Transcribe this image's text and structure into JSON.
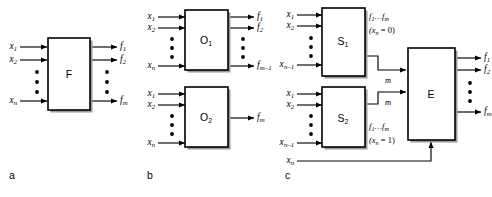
{
  "figure": {
    "panels": [
      {
        "id": "a",
        "letter": "a",
        "boxes": [
          {
            "name": "F",
            "label": "F",
            "inputs": [
              "x1",
              "x2",
              "vdots",
              "xn"
            ],
            "outputs": [
              "f1",
              "f2",
              "vdots",
              "fm"
            ]
          }
        ]
      },
      {
        "id": "b",
        "letter": "b",
        "boxes": [
          {
            "name": "O1",
            "label": "O",
            "sub": "1",
            "inputs": [
              "x1",
              "x2",
              "vdots",
              "xn"
            ],
            "outputs": [
              "f1",
              "f2",
              "vdots",
              "fm-1"
            ]
          },
          {
            "name": "O2",
            "label": "O",
            "sub": "2",
            "inputs": [
              "x1",
              "x2",
              "vdots",
              "xn"
            ],
            "outputs": [
              "fm"
            ]
          }
        ]
      },
      {
        "id": "c",
        "letter": "c",
        "boxes": [
          {
            "name": "S1",
            "label": "S",
            "sub": "1",
            "inputs": [
              "x1",
              "x2",
              "vdots",
              "xn-1"
            ]
          },
          {
            "name": "S2",
            "label": "S",
            "sub": "2",
            "inputs": [
              "x1",
              "x2",
              "vdots",
              "xn-1"
            ]
          },
          {
            "name": "E",
            "label": "E",
            "outputs": [
              "f1",
              "f2",
              "vdots",
              "fm"
            ]
          }
        ],
        "extra_input": "xn"
      }
    ]
  },
  "labels": {
    "x1": "x",
    "x1_sub": "1",
    "x2": "x",
    "x2_sub": "2",
    "xn": "x",
    "xn_sub": "n",
    "xn1": "x",
    "xn1_sub": "n–1",
    "f1": "f",
    "f1_sub": "1",
    "f2": "f",
    "f2_sub": "2",
    "fm": "f",
    "fm_sub": "m",
    "fm1": "f",
    "fm1_sub": "m–1",
    "m_bus": "m"
  },
  "box_labels": {
    "F": "F",
    "O": "O",
    "O1_sub": "1",
    "O2_sub": "2",
    "S": "S",
    "S1_sub": "1",
    "S2_sub": "2",
    "E": "E"
  },
  "notes": {
    "bus_top_main": "f",
    "bus_top_sub1": "1",
    "bus_top_mid": "…f",
    "bus_top_sub2": "m",
    "cond_zero": "(x",
    "cond_zero_sub": "n",
    "cond_zero_tail": " = 0)",
    "cond_one": "(x",
    "cond_one_sub": "n",
    "cond_one_tail": " = 1)"
  },
  "panel_letters": {
    "a": "a",
    "b": "b",
    "c": "c"
  },
  "colors": {
    "line": "#000000",
    "box_border": "#000000",
    "box_fill": "#ffffff",
    "shadow": "#9a9a9a",
    "background": "#ffffff",
    "text": "#000000"
  }
}
